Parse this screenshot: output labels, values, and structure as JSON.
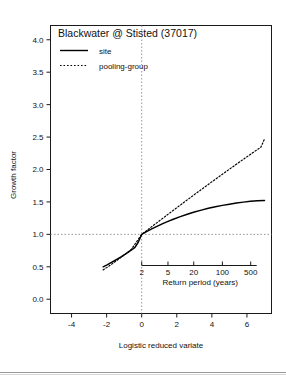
{
  "chart_data": {
    "type": "line",
    "title": "Blackwater @ Stisted (37017)",
    "xlabel": "Logistic reduced variate",
    "ylabel": "Growth factor",
    "xlim": [
      -5.2,
      7.4
    ],
    "ylim": [
      -0.22,
      4.22
    ],
    "grid": false,
    "legend_position": "top-left",
    "xticks": [
      -4,
      -2,
      0,
      2,
      4,
      6
    ],
    "xtick_labels": [
      "-4",
      "-2",
      "0",
      "2",
      "4",
      "6"
    ],
    "yticks": [
      0.0,
      0.5,
      1.0,
      1.5,
      2.0,
      2.5,
      3.0,
      3.5,
      4.0
    ],
    "ytick_labels": [
      "0.0",
      "0.5",
      "1.0",
      "1.5",
      "2.0",
      "2.5",
      "3.0",
      "3.5",
      "4.0"
    ],
    "reference_lines": [
      {
        "name": "growth-factor-unity",
        "orientation": "horizontal",
        "value": 1.0,
        "style": "dotted"
      },
      {
        "name": "median-variate",
        "orientation": "vertical",
        "value": 0.0,
        "style": "dotted"
      }
    ],
    "secondary_axis": {
      "name": "return-period-axis",
      "label": "Return period (years)",
      "ticks": [
        2,
        5,
        20,
        100,
        500
      ],
      "tick_labels": [
        "2",
        "5",
        "20",
        "100",
        "500"
      ],
      "tick_variates": [
        0.0,
        1.4979,
        2.9657,
        4.6002,
        6.2146
      ]
    },
    "series": [
      {
        "name": "site",
        "style": "solid",
        "color": "#000000",
        "x": [
          -2.2,
          -2.0,
          -1.8,
          -1.6,
          -1.4,
          -1.2,
          -1.0,
          -0.8,
          -0.6,
          -0.4,
          -0.2,
          0.0,
          0.3,
          0.6,
          0.9,
          1.2,
          1.5,
          1.8,
          2.2,
          2.6,
          3.0,
          3.4,
          3.8,
          4.2,
          4.6,
          5.0,
          5.4,
          5.8,
          6.2,
          6.6,
          7.0
        ],
        "y": [
          0.5,
          0.527,
          0.556,
          0.586,
          0.617,
          0.65,
          0.684,
          0.719,
          0.756,
          0.794,
          0.878,
          1.0,
          1.045,
          1.088,
          1.128,
          1.166,
          1.201,
          1.234,
          1.274,
          1.311,
          1.344,
          1.374,
          1.401,
          1.425,
          1.447,
          1.466,
          1.483,
          1.497,
          1.509,
          1.517,
          1.523
        ]
      },
      {
        "name": "pooling-group",
        "style": "dotted",
        "color": "#000000",
        "x": [
          -2.2,
          -2.0,
          -1.8,
          -1.6,
          -1.4,
          -1.2,
          -1.0,
          -0.8,
          -0.6,
          -0.4,
          -0.2,
          0.0,
          0.4,
          0.8,
          1.2,
          1.6,
          2.0,
          2.4,
          2.8,
          3.2,
          3.6,
          4.0,
          4.4,
          4.8,
          5.2,
          5.6,
          6.0,
          6.4,
          6.8,
          7.0
        ],
        "y": [
          0.452,
          0.487,
          0.524,
          0.562,
          0.601,
          0.641,
          0.682,
          0.724,
          0.766,
          0.844,
          0.922,
          1.0,
          1.083,
          1.166,
          1.248,
          1.33,
          1.411,
          1.492,
          1.572,
          1.652,
          1.731,
          1.81,
          1.888,
          1.966,
          2.043,
          2.12,
          2.196,
          2.271,
          2.346,
          2.47
        ]
      }
    ]
  }
}
